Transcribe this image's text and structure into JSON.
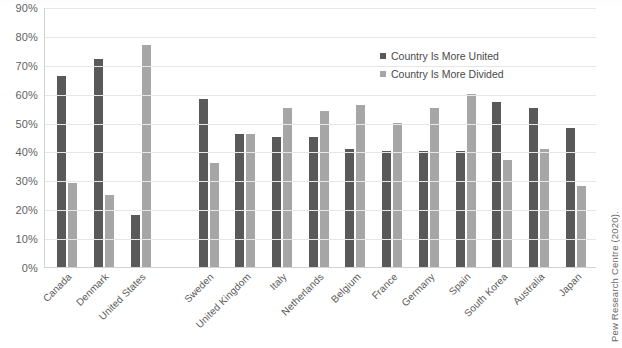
{
  "chart_data": {
    "type": "bar",
    "title": "",
    "xlabel": "",
    "ylabel": "",
    "ylim": [
      0,
      90
    ],
    "grid": true,
    "legend_position": "inside-top-right",
    "y_ticks": [
      "90%",
      "80%",
      "70%",
      "60%",
      "50%",
      "40%",
      "30%",
      "20%",
      "10%",
      "0%"
    ],
    "categories": [
      "Canada",
      "Denmark",
      "United States",
      "Sweden",
      "United Kingdom",
      "Italy",
      "Netherlands",
      "Belgium",
      "France",
      "Germany",
      "Spain",
      "South Korea",
      "Australia",
      "Japan"
    ],
    "series": [
      {
        "name": "Country Is More United",
        "color": "#595959",
        "values": [
          66,
          72,
          18,
          58,
          46,
          45,
          45,
          41,
          40,
          40,
          40,
          57,
          55,
          48
        ]
      },
      {
        "name": "Country Is More Divided",
        "color": "#a6a6a6",
        "values": [
          29,
          25,
          77,
          36,
          46,
          55,
          54,
          56,
          50,
          55,
          60,
          37,
          41,
          28
        ]
      }
    ],
    "group_gap_after_index": 2,
    "source": "Pew Research Centre (2020)."
  },
  "legend": {
    "items": [
      {
        "label": "Country Is More United"
      },
      {
        "label": "Country Is More Divided"
      }
    ]
  }
}
